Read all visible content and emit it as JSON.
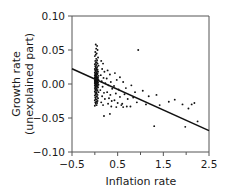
{
  "chart_data": {
    "type": "scatter",
    "title": "",
    "xlabel": "Inflation rate",
    "ylabel_line1": "Growth rate",
    "ylabel_line2": "(unexplained part)",
    "xlim": [
      -0.5,
      2.5
    ],
    "ylim": [
      -0.1,
      0.1
    ],
    "xticks": [
      -0.5,
      0.5,
      1.5,
      2.5
    ],
    "xtick_labels": [
      "−0.5",
      "0.5",
      "1.5",
      "2.5"
    ],
    "xminor_ticks": [
      0.0,
      1.0,
      2.0
    ],
    "yticks": [
      0.1,
      0.05,
      0.0,
      -0.05,
      -0.1
    ],
    "ytick_labels": [
      "0.10",
      "0.05",
      "0.00",
      "−0.05",
      "−0.10"
    ],
    "grid": false,
    "legend": null,
    "marker_color": "#111111",
    "line_color": "#111111",
    "frame_color": "#555555",
    "fit_line": {
      "name": "regression line",
      "x": [
        -0.5,
        2.5
      ],
      "y": [
        0.0225,
        -0.0685
      ],
      "slope": -0.0303,
      "intercept": 0.0074
    },
    "points": [
      [
        0.02,
        0.058
      ],
      [
        0.05,
        0.056
      ],
      [
        0.03,
        0.052
      ],
      [
        0.06,
        0.05
      ],
      [
        0.01,
        0.047
      ],
      [
        0.04,
        0.045
      ],
      [
        0.02,
        0.043
      ],
      [
        0.0,
        0.041
      ],
      [
        0.07,
        0.039
      ],
      [
        0.03,
        0.037
      ],
      [
        0.05,
        0.035
      ],
      [
        0.01,
        0.034
      ],
      [
        0.04,
        0.032
      ],
      [
        0.02,
        0.031
      ],
      [
        0.06,
        0.03
      ],
      [
        0.0,
        0.029
      ],
      [
        0.03,
        0.028
      ],
      [
        0.08,
        0.027
      ],
      [
        0.01,
        0.026
      ],
      [
        0.05,
        0.025
      ],
      [
        0.02,
        0.024
      ],
      [
        0.04,
        0.023
      ],
      [
        0.0,
        0.022
      ],
      [
        0.06,
        0.021
      ],
      [
        0.03,
        0.021
      ],
      [
        0.01,
        0.02
      ],
      [
        0.05,
        0.019
      ],
      [
        0.02,
        0.019
      ],
      [
        0.07,
        0.018
      ],
      [
        0.0,
        0.017
      ],
      [
        0.04,
        0.017
      ],
      [
        0.03,
        0.016
      ],
      [
        0.01,
        0.015
      ],
      [
        0.06,
        0.015
      ],
      [
        0.02,
        0.014
      ],
      [
        0.05,
        0.014
      ],
      [
        0.0,
        0.013
      ],
      [
        0.03,
        0.013
      ],
      [
        0.08,
        0.012
      ],
      [
        0.01,
        0.012
      ],
      [
        0.04,
        0.011
      ],
      [
        0.02,
        0.011
      ],
      [
        0.06,
        0.01
      ],
      [
        0.0,
        0.01
      ],
      [
        0.03,
        0.01
      ],
      [
        0.05,
        0.009
      ],
      [
        0.01,
        0.009
      ],
      [
        0.07,
        0.009
      ],
      [
        0.02,
        0.008
      ],
      [
        0.04,
        0.008
      ],
      [
        0.0,
        0.008
      ],
      [
        0.06,
        0.007
      ],
      [
        0.03,
        0.007
      ],
      [
        0.01,
        0.007
      ],
      [
        0.05,
        0.006
      ],
      [
        0.02,
        0.006
      ],
      [
        0.08,
        0.006
      ],
      [
        0.0,
        0.005
      ],
      [
        0.04,
        0.005
      ],
      [
        0.03,
        0.005
      ],
      [
        0.01,
        0.004
      ],
      [
        0.06,
        0.004
      ],
      [
        0.02,
        0.004
      ],
      [
        0.05,
        0.003
      ],
      [
        0.0,
        0.003
      ],
      [
        0.03,
        0.003
      ],
      [
        0.07,
        0.002
      ],
      [
        0.01,
        0.002
      ],
      [
        0.04,
        0.002
      ],
      [
        0.02,
        0.001
      ],
      [
        0.06,
        0.001
      ],
      [
        0.0,
        0.001
      ],
      [
        0.03,
        0.0
      ],
      [
        0.05,
        0.0
      ],
      [
        0.01,
        0.0
      ],
      [
        0.08,
        -0.001
      ],
      [
        0.02,
        -0.001
      ],
      [
        0.04,
        -0.002
      ],
      [
        0.0,
        -0.002
      ],
      [
        0.06,
        -0.003
      ],
      [
        0.03,
        -0.003
      ],
      [
        0.01,
        -0.004
      ],
      [
        0.05,
        -0.004
      ],
      [
        0.02,
        -0.005
      ],
      [
        0.07,
        -0.005
      ],
      [
        0.0,
        -0.006
      ],
      [
        0.04,
        -0.007
      ],
      [
        0.03,
        -0.007
      ],
      [
        0.01,
        -0.008
      ],
      [
        0.06,
        -0.009
      ],
      [
        0.02,
        -0.009
      ],
      [
        0.05,
        -0.01
      ],
      [
        0.0,
        -0.011
      ],
      [
        0.03,
        -0.012
      ],
      [
        0.08,
        -0.012
      ],
      [
        0.01,
        -0.013
      ],
      [
        0.04,
        -0.014
      ],
      [
        0.02,
        -0.015
      ],
      [
        0.06,
        -0.016
      ],
      [
        0.0,
        -0.017
      ],
      [
        0.03,
        -0.018
      ],
      [
        0.05,
        -0.019
      ],
      [
        0.01,
        -0.02
      ],
      [
        0.07,
        -0.021
      ],
      [
        0.02,
        -0.022
      ],
      [
        0.04,
        -0.023
      ],
      [
        0.0,
        -0.024
      ],
      [
        0.06,
        -0.025
      ],
      [
        0.03,
        -0.026
      ],
      [
        0.01,
        -0.027
      ],
      [
        0.05,
        -0.028
      ],
      [
        0.02,
        -0.029
      ],
      [
        0.04,
        -0.031
      ],
      [
        0.0,
        -0.032
      ],
      [
        0.14,
        0.034
      ],
      [
        0.18,
        0.03
      ],
      [
        0.16,
        0.022
      ],
      [
        0.21,
        0.018
      ],
      [
        0.13,
        0.013
      ],
      [
        0.19,
        0.009
      ],
      [
        0.15,
        0.004
      ],
      [
        0.23,
        0.001
      ],
      [
        0.17,
        -0.004
      ],
      [
        0.12,
        -0.009
      ],
      [
        0.2,
        -0.013
      ],
      [
        0.16,
        -0.018
      ],
      [
        0.22,
        -0.022
      ],
      [
        0.14,
        -0.027
      ],
      [
        0.18,
        -0.031
      ],
      [
        0.28,
        0.02
      ],
      [
        0.33,
        0.014
      ],
      [
        0.26,
        0.008
      ],
      [
        0.35,
        0.003
      ],
      [
        0.3,
        -0.002
      ],
      [
        0.38,
        -0.007
      ],
      [
        0.27,
        -0.012
      ],
      [
        0.34,
        -0.016
      ],
      [
        0.31,
        -0.021
      ],
      [
        0.37,
        -0.025
      ],
      [
        0.29,
        -0.029
      ],
      [
        0.36,
        -0.033
      ],
      [
        0.44,
        0.016
      ],
      [
        0.48,
        0.006
      ],
      [
        0.42,
        -0.003
      ],
      [
        0.52,
        -0.008
      ],
      [
        0.46,
        -0.014
      ],
      [
        0.55,
        -0.019
      ],
      [
        0.43,
        -0.024
      ],
      [
        0.5,
        -0.028
      ],
      [
        0.58,
        -0.031
      ],
      [
        0.47,
        -0.034
      ],
      [
        0.62,
        0.003
      ],
      [
        0.68,
        -0.006
      ],
      [
        0.65,
        -0.015
      ],
      [
        0.72,
        -0.022
      ],
      [
        0.6,
        -0.029
      ],
      [
        0.7,
        -0.033
      ],
      [
        0.8,
        -0.002
      ],
      [
        0.88,
        -0.012
      ],
      [
        0.84,
        -0.02
      ],
      [
        0.92,
        -0.027
      ],
      [
        0.95,
        0.05
      ],
      [
        0.33,
        -0.044
      ],
      [
        0.2,
        -0.047
      ],
      [
        1.05,
        -0.01
      ],
      [
        1.18,
        -0.018
      ],
      [
        1.12,
        -0.03
      ],
      [
        1.35,
        -0.016
      ],
      [
        1.42,
        -0.031
      ],
      [
        1.3,
        -0.062
      ],
      [
        1.62,
        -0.026
      ],
      [
        1.75,
        -0.023
      ],
      [
        1.92,
        -0.03
      ],
      [
        1.98,
        -0.063
      ],
      [
        2.05,
        -0.036
      ],
      [
        2.18,
        -0.028
      ],
      [
        2.25,
        -0.055
      ],
      [
        2.12,
        -0.03
      ],
      [
        0.55,
        0.01
      ],
      [
        0.62,
        -0.034
      ],
      [
        0.78,
        -0.033
      ]
    ]
  }
}
